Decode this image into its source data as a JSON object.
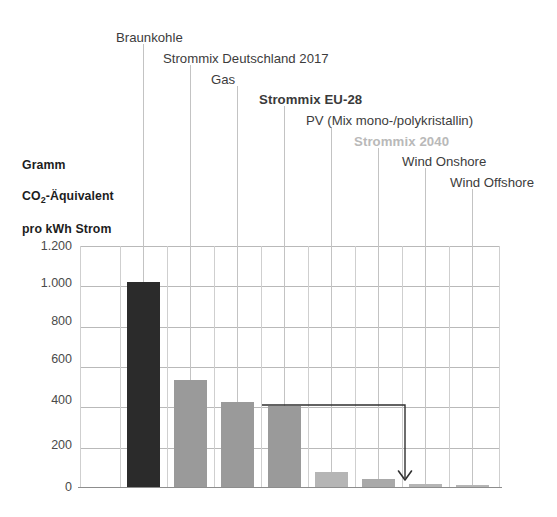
{
  "axis_title": {
    "line1": "Gramm",
    "line2_pre": "CO",
    "line2_sub": "2",
    "line2_post": "-Äquivalent",
    "line3": "pro kWh Strom"
  },
  "colors": {
    "bar_dark": "#2b2b2b",
    "bar_mid": "#9a9a9a",
    "bar_light": "#b5b5b5",
    "grid": "#c9c9c9",
    "text": "#3c3c3c",
    "text_muted": "#bcbcbc",
    "leader": "#c3c3c3",
    "arrow": "#2f2f2f"
  },
  "chart_data": {
    "type": "bar",
    "title": "",
    "subtitle": "",
    "xlabel": "",
    "ylabel": "Gramm CO2-Äquivalent pro kWh Strom",
    "ylim": [
      0,
      1200
    ],
    "yticks": [
      "0",
      "200",
      "400",
      "600",
      "800",
      "1.000",
      "1.200"
    ],
    "ytick_values": [
      0,
      200,
      400,
      600,
      800,
      1000,
      1200
    ],
    "grid": true,
    "legend": "none",
    "categories": [
      "Braunkohle",
      "Strommix Deutschland 2017",
      "Gas",
      "Strommix EU-28",
      "PV (Mix mono-/polykristallin)",
      "Strommix 2040",
      "Wind Onshore",
      "Wind Offshore"
    ],
    "values": [
      1020,
      535,
      425,
      405,
      80,
      45,
      20,
      14
    ],
    "bar_colors": [
      "#2b2b2b",
      "#9a9a9a",
      "#9a9a9a",
      "#9a9a9a",
      "#b5b5b5",
      "#a9a9a9",
      "#b5b5b5",
      "#b5b5b5"
    ],
    "label_styles": [
      "normal",
      "normal",
      "normal",
      "bold",
      "normal",
      "bold-muted",
      "normal",
      "normal"
    ],
    "annotation": {
      "kind": "arrow",
      "from_category": "Strommix EU-28",
      "from_value": 405,
      "to_category": "Strommix 2040",
      "to_value": 45,
      "label": ""
    }
  }
}
